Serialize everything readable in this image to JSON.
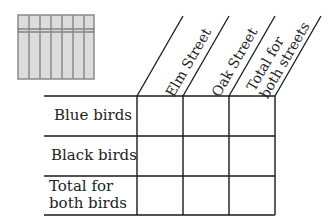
{
  "figure": {
    "type": "two-way table template",
    "columns": [
      {
        "label_line1": "Elm Street",
        "label_line2": ""
      },
      {
        "label_line1": "Oak Street",
        "label_line2": ""
      },
      {
        "label_line1": "Total for",
        "label_line2": "both streets"
      }
    ],
    "rows": [
      {
        "label_line1": "Blue birds",
        "label_line2": ""
      },
      {
        "label_line1": "Black birds",
        "label_line2": ""
      },
      {
        "label_line1": "Total for",
        "label_line2": "both birds"
      }
    ],
    "cells": [
      [
        "",
        "",
        ""
      ],
      [
        "",
        "",
        ""
      ],
      [
        "",
        "",
        ""
      ]
    ],
    "icon": "fence-icon",
    "colors": {
      "lines": "#1a1a1a",
      "icon_fill": "#d9d9d9",
      "icon_stroke": "#8a8a8a"
    }
  }
}
